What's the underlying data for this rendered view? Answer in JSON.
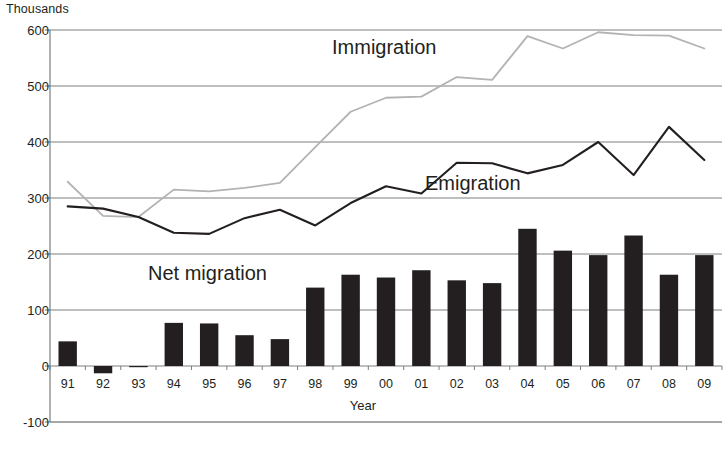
{
  "chart_data": {
    "type": "bar",
    "title": "",
    "unit_label": "Thousands",
    "xlabel": "Year",
    "ylabel": "",
    "ylim": [
      -100,
      600
    ],
    "yticks": [
      600,
      500,
      400,
      300,
      200,
      100,
      0,
      -100
    ],
    "grid": true,
    "legend_position": "inline-annotations",
    "categories": [
      "91",
      "92",
      "93",
      "94",
      "95",
      "96",
      "97",
      "98",
      "99",
      "00",
      "01",
      "02",
      "03",
      "04",
      "05",
      "06",
      "07",
      "08",
      "09"
    ],
    "series": [
      {
        "name": "Immigration",
        "type": "line",
        "color": "#b3b3b3",
        "values": [
          329,
          268,
          266,
          315,
          312,
          318,
          327,
          391,
          454,
          479,
          481,
          516,
          511,
          589,
          567,
          596,
          591,
          590,
          567
        ]
      },
      {
        "name": "Emigration",
        "type": "line",
        "color": "#231f20",
        "values": [
          285,
          281,
          266,
          238,
          236,
          264,
          279,
          251,
          291,
          321,
          308,
          363,
          362,
          344,
          359,
          400,
          341,
          427,
          368
        ]
      },
      {
        "name": "Net migration",
        "type": "bar",
        "color": "#231f20",
        "values": [
          44,
          -13,
          -1,
          77,
          76,
          55,
          48,
          140,
          163,
          158,
          171,
          153,
          148,
          245,
          206,
          198,
          233,
          163,
          198
        ]
      }
    ],
    "annotations": [
      {
        "name": "Immigration",
        "x_category": "99",
        "y_value": 560
      },
      {
        "name": "Emigration",
        "x_category": "03",
        "y_value": 315
      },
      {
        "name": "Net migration",
        "x_category": "94",
        "y_value": 130
      }
    ]
  }
}
